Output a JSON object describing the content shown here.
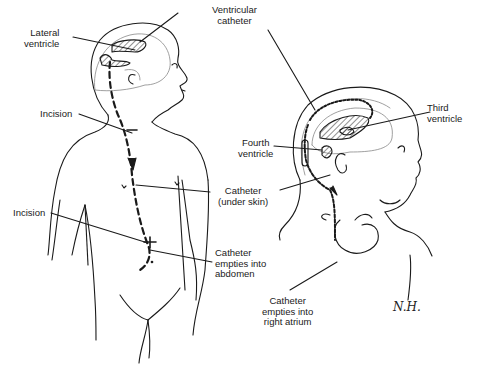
{
  "figure": {
    "left_panel": {
      "name": "ventriculoperitoneal-shunt",
      "labels": {
        "lateral_ventricle": "Lateral\nventricle",
        "incision_neck": "Incision",
        "incision_abdomen": "Incision",
        "catheter_under_skin": "Catheter\n(under skin)",
        "catheter_abdomen": "Catheter\nempties into\nabdomen"
      }
    },
    "right_panel": {
      "name": "ventriculoatrial-shunt",
      "labels": {
        "ventricular_catheter": "Ventricular\ncatheter",
        "third_ventricle": "Third\nventricle",
        "fourth_ventricle": "Fourth\nventricle",
        "catheter_atrium": "Catheter\nempties into\nright atrium"
      }
    },
    "signature": "N.H."
  },
  "colors": {
    "ink": "#1a1a1a",
    "background": "#ffffff"
  }
}
